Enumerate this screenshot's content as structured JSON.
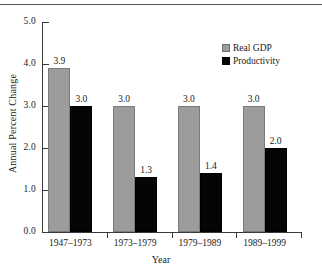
{
  "figure": {
    "top_rule": true,
    "background": "#ffffff"
  },
  "legend": {
    "position": "top-right",
    "entries": [
      {
        "label": "Real GDP",
        "color": "#9c9c9c",
        "swatch": "gray-square-icon"
      },
      {
        "label": "Productivity",
        "color": "#050505",
        "swatch": "black-square-icon"
      }
    ]
  },
  "axes": {
    "y_title": "Annual Percent Change",
    "x_title": "Year",
    "y_ticks": [
      "0.0",
      "1.0",
      "2.0",
      "3.0",
      "4.0",
      "5.0"
    ]
  },
  "chart_data": {
    "type": "bar",
    "title": "",
    "subtitle": "",
    "xlabel": "Year",
    "ylabel": "Annual Percent Change",
    "categories": [
      "1947–1973",
      "1973–1979",
      "1979–1989",
      "1989–1999"
    ],
    "series": [
      {
        "name": "Real GDP",
        "color": "#9c9c9c",
        "values": [
          3.9,
          3.0,
          3.0,
          3.0
        ],
        "labels": [
          "3.9",
          "3.0",
          "3.0",
          "3.0"
        ]
      },
      {
        "name": "Productivity",
        "color": "#050505",
        "values": [
          3.0,
          1.3,
          1.4,
          2.0
        ],
        "labels": [
          "3.0",
          "1.3",
          "1.4",
          "2.0"
        ]
      }
    ],
    "ylim": [
      0.0,
      5.0
    ],
    "ytick_step": 1.0,
    "ytick_labels": [
      "0.0",
      "1.0",
      "2.0",
      "3.0",
      "4.0",
      "5.0"
    ],
    "xtick_labels": [
      "1947–1973",
      "1973–1979",
      "1979–1989",
      "1989–1999"
    ],
    "grid": false,
    "legend_position": "upper right",
    "data_labels": true
  }
}
